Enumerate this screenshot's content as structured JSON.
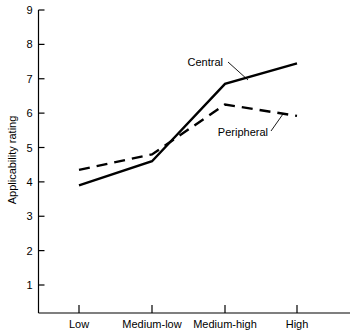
{
  "chart_data": {
    "type": "line",
    "title": "",
    "xlabel": "",
    "ylabel": "Applicability rating",
    "categories": [
      "Low",
      "Medium-low",
      "Medium-high",
      "High"
    ],
    "ylim": [
      0,
      9
    ],
    "ytick_labels": [
      "1",
      "2",
      "3",
      "4",
      "5",
      "6",
      "7",
      "8",
      "9"
    ],
    "ytick_values": [
      1,
      2,
      3,
      4,
      5,
      6,
      7,
      8,
      9
    ],
    "grid": false,
    "legend_position": "inline-annotations",
    "series": [
      {
        "name": "Central",
        "style": "solid",
        "color": "#000000",
        "values": [
          3.9,
          4.6,
          6.85,
          7.45
        ]
      },
      {
        "name": "Peripheral",
        "style": "dashed",
        "color": "#000000",
        "values": [
          4.35,
          4.8,
          6.25,
          5.92
        ]
      }
    ],
    "annotations": [
      {
        "text": "Central",
        "series": "Central"
      },
      {
        "text": "Peripheral",
        "series": "Peripheral"
      }
    ]
  }
}
